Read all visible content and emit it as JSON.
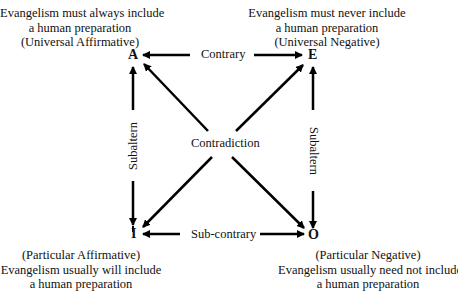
{
  "diagram": {
    "type": "square-of-opposition",
    "corners": {
      "A": {
        "letter": "A",
        "lines": [
          "Evangelism must always include",
          "a human preparation",
          "(Universal Affirmative)"
        ]
      },
      "E": {
        "letter": "E",
        "lines": [
          "Evangelism must never include",
          "a human preparation",
          "(Universal Negative)"
        ]
      },
      "I": {
        "letter": "I",
        "lines": [
          "(Particular Affirmative)",
          "Evangelism usually will include",
          "a human preparation"
        ]
      },
      "O": {
        "letter": "O",
        "lines": [
          "(Particular Negative)",
          "Evangelism usually need not include",
          "a human preparation"
        ]
      }
    },
    "relations": {
      "top": "Contrary",
      "bottom": "Sub-contrary",
      "left": "Subaltern",
      "right": "Subaltern",
      "center": "Contradiction"
    },
    "colors": {
      "line": "#000000",
      "text": "#111111",
      "background": "#ffffff"
    }
  }
}
